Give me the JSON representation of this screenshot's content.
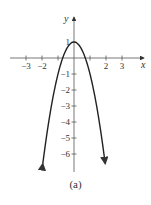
{
  "chart_data": {
    "type": "line",
    "title": "",
    "function": "y = 1 - 2x^2",
    "xlabel": "x",
    "ylabel": "y",
    "x_ticks": [
      -3,
      -2,
      2,
      3
    ],
    "x_tick_labels": [
      "−3",
      "−2",
      "2",
      "3"
    ],
    "x_unlabeled_ticks": [
      -1,
      1
    ],
    "y_ticks": [
      1,
      -1,
      -2,
      -3,
      -4,
      -5,
      -6
    ],
    "y_tick_labels": [
      "1",
      "−1",
      "−2",
      "−3",
      "−4",
      "−5",
      "−6"
    ],
    "xlim": [
      -4,
      4.4
    ],
    "ylim": [
      -7,
      2.5
    ],
    "grid": false,
    "series": [
      {
        "name": "parabola",
        "x": [
          -2,
          -1.5,
          -1,
          -0.707,
          -0.5,
          0,
          0.5,
          0.707,
          1,
          1.5,
          2
        ],
        "y": [
          -7,
          -3.5,
          -1,
          0,
          0.5,
          1,
          0.5,
          0,
          -1,
          -3.5,
          -7
        ],
        "arrows_at_ends": true
      }
    ],
    "caption": "(a)"
  },
  "labels": {
    "x_axis": "x",
    "y_axis": "y",
    "caption": "(a)"
  }
}
